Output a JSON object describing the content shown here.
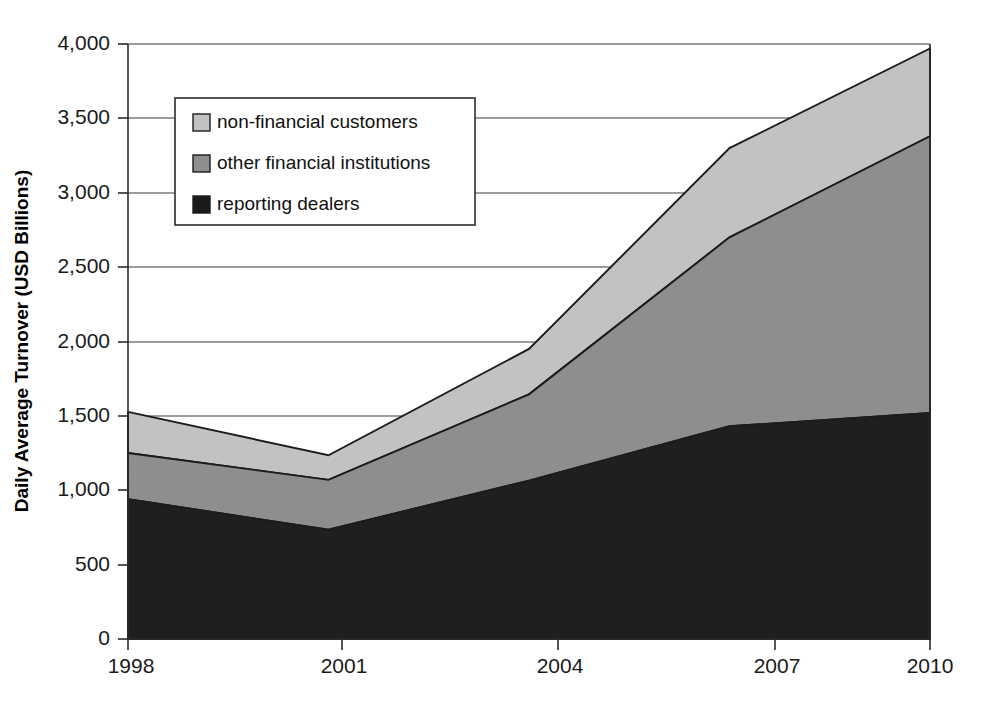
{
  "chart_data": {
    "type": "area",
    "stacked": true,
    "title": "",
    "subtitle": "",
    "xlabel": "",
    "ylabel": "Daily Average Turnover (USD Billions)",
    "x": [
      1998,
      2001,
      2004,
      2007,
      2010
    ],
    "xtick_labels": [
      "1998",
      "2001",
      "2004",
      "2007",
      "2010"
    ],
    "ytick_labels": [
      "0",
      "500",
      "1,000",
      "1,500",
      "2,000",
      "2,500",
      "3,000",
      "3,500",
      "4,000"
    ],
    "ytick_values": [
      0,
      500,
      1000,
      1500,
      2000,
      2500,
      3000,
      3500,
      4000
    ],
    "ylim": [
      0,
      4000
    ],
    "xlim": [
      1998,
      2010
    ],
    "grid": "horizontal",
    "legend_position": "upper-left-inside",
    "series": [
      {
        "name": "reporting dealers",
        "color": "#1a1a1a",
        "order": 1,
        "values": [
          940,
          735,
          1065,
          1430,
          1520
        ],
        "cumulative": [
          940,
          735,
          1065,
          1430,
          1520
        ]
      },
      {
        "name": "other financial institutions",
        "color": "#8e8e8e",
        "order": 2,
        "values": [
          310,
          335,
          580,
          1270,
          1860
        ],
        "cumulative": [
          1250,
          1070,
          1645,
          2700,
          3380
        ]
      },
      {
        "name": "non-financial customers",
        "color": "#c2c2c2",
        "order": 3,
        "values": [
          277,
          165,
          305,
          600,
          590
        ],
        "cumulative": [
          1527,
          1235,
          1950,
          3300,
          3970
        ]
      }
    ],
    "legend_entries": [
      {
        "label": "non-financial customers",
        "color": "#c2c2c2"
      },
      {
        "label": "other financial institutions",
        "color": "#8e8e8e"
      },
      {
        "label": "reporting dealers",
        "color": "#1a1a1a"
      }
    ]
  },
  "axes": {
    "y_title": "Daily Average Turnover (USD Billions)"
  },
  "ticks": {
    "y": [
      {
        "label": "4,000"
      },
      {
        "label": "3,500"
      },
      {
        "label": "3,000"
      },
      {
        "label": "2,500"
      },
      {
        "label": "2,000"
      },
      {
        "label": "1,500"
      },
      {
        "label": "1,000"
      },
      {
        "label": "500"
      },
      {
        "label": "0"
      }
    ],
    "x": [
      {
        "label": "1998"
      },
      {
        "label": "2001"
      },
      {
        "label": "2004"
      },
      {
        "label": "2007"
      },
      {
        "label": "2010"
      }
    ]
  },
  "legend": {
    "items": [
      {
        "label": "non-financial customers"
      },
      {
        "label": "other financial institutions"
      },
      {
        "label": "reporting dealers"
      }
    ]
  }
}
